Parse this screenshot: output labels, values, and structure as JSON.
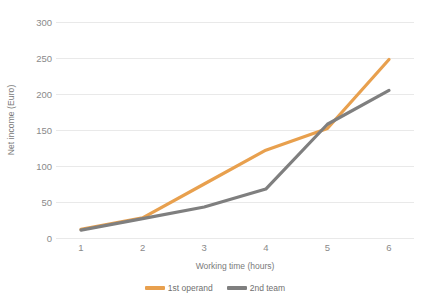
{
  "chart_data": {
    "type": "line",
    "title": "",
    "subtitle": "",
    "xlabel": "Working time (hours)",
    "ylabel": "Net income (Euro)",
    "categories": [
      "1",
      "2",
      "3",
      "4",
      "5",
      "6"
    ],
    "x": [
      1,
      2,
      3,
      4,
      5,
      6
    ],
    "ylim": [
      0,
      300
    ],
    "yticks": [
      0,
      50,
      100,
      150,
      200,
      250,
      300
    ],
    "ytick_labels": [
      "0",
      "50",
      "100",
      "150",
      "200",
      "250",
      "300"
    ],
    "grid": true,
    "grid_axis": "y",
    "legend_position": "bottom",
    "series": [
      {
        "name": "1st operand",
        "color": "#E8A04E",
        "values": [
          12,
          28,
          75,
          122,
          152,
          248
        ]
      },
      {
        "name": "2nd team",
        "color": "#7F7F7F",
        "values": [
          11,
          27,
          43,
          68,
          158,
          205
        ]
      }
    ]
  },
  "colors": {
    "series_1": "#E8A04E",
    "series_2": "#7F7F7F",
    "gridline": "#E9E9E9",
    "text": "#808080",
    "background": "#FFFFFF"
  }
}
